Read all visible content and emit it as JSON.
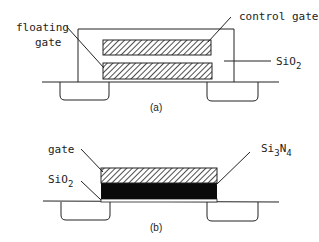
{
  "diagram_a": {
    "caption": "(a)",
    "labels": {
      "floating_gate_line1": "floating",
      "floating_gate_line2": "gate",
      "control_gate": "control gate",
      "oxide": "SiO",
      "oxide_sub": "2"
    }
  },
  "diagram_b": {
    "caption": "(b)",
    "labels": {
      "gate": "gate",
      "oxide": "SiO",
      "oxide_sub": "2",
      "nitride_si": "Si",
      "nitride_sub1": "3",
      "nitride_n": "N",
      "nitride_sub2": "4"
    }
  },
  "colors": {
    "stroke": "#222222",
    "fill_dark": "#0a0a0a",
    "background": "#ffffff"
  }
}
